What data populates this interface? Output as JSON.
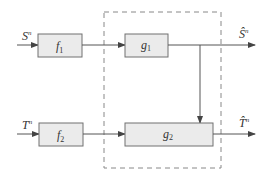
{
  "diagram": {
    "inputs": [
      {
        "symbol": "S",
        "superscript": "n"
      },
      {
        "symbol": "T",
        "superscript": "n"
      }
    ],
    "outputs": [
      {
        "symbol": "Ŝ",
        "superscript": "n"
      },
      {
        "symbol": "T̂",
        "superscript": "n"
      }
    ],
    "encoders": [
      {
        "symbol": "f",
        "subscript": "1"
      },
      {
        "symbol": "f",
        "subscript": "2"
      }
    ],
    "decoders": [
      {
        "symbol": "g",
        "subscript": "1"
      },
      {
        "symbol": "g",
        "subscript": "2"
      }
    ],
    "colors": {
      "box_fill": "#ebebeb",
      "box_stroke": "#707070",
      "line": "#555555",
      "dashed": "#888888"
    }
  }
}
